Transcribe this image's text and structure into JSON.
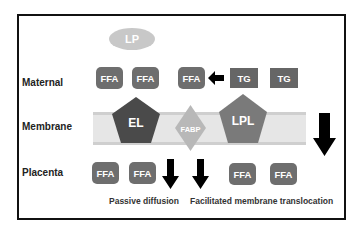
{
  "diagram": {
    "rows": {
      "maternal": "Maternal",
      "membrane": "Membrane",
      "placenta": "Placenta"
    },
    "lipoprotein": "LP",
    "maternal_items": [
      "FFA",
      "FFA",
      "FFA",
      "TG",
      "TG"
    ],
    "membrane_proteins": {
      "el": "EL",
      "fabp": "FABP",
      "lpl": "LPL"
    },
    "placenta_items": [
      "FFA",
      "FFA",
      "FFA",
      "FFA"
    ],
    "captions": {
      "passive": "Passive diffusion",
      "facilitated": "Facilitated membrane translocation"
    },
    "colors": {
      "ffa": "#6e6e6e",
      "tg": "#666666",
      "lp": "#c8c8c8",
      "el": "#4a4a4a",
      "lpl": "#7a7a7a",
      "fabp": "#b8b8b8",
      "membrane": "#e6e6e6",
      "arrow": "#000000"
    }
  }
}
